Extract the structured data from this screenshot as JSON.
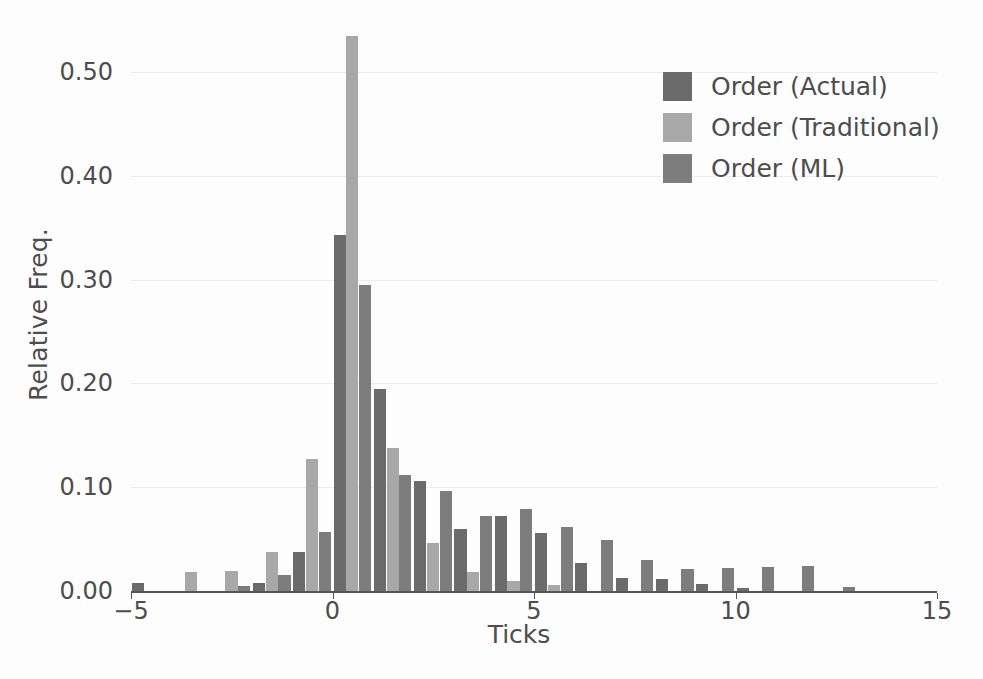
{
  "chart_data": {
    "type": "bar",
    "title": "",
    "subtitle": "",
    "xlabel": "Ticks",
    "ylabel": "Relative Freq.",
    "xlim": [
      -5,
      15
    ],
    "ylim": [
      0.0,
      0.55
    ],
    "xticks": [
      -5,
      0,
      5,
      10,
      15
    ],
    "xtick_labels": [
      "−5",
      "0",
      "5",
      "10",
      "15"
    ],
    "yticks": [
      0.0,
      0.1,
      0.2,
      0.3,
      0.4,
      0.5
    ],
    "ytick_labels": [
      "0.00",
      "0.10",
      "0.20",
      "0.30",
      "0.40",
      "0.50"
    ],
    "grid": true,
    "grid_axis": "y",
    "legend_position": "upper right",
    "bin_width": 1,
    "categories": [
      -5,
      -4,
      -3,
      -2,
      -1,
      0,
      1,
      2,
      3,
      4,
      5,
      6,
      7,
      8,
      9,
      10,
      11,
      12,
      13,
      14
    ],
    "series": [
      {
        "name": "Order (Actual)",
        "color": "#6b6b6b",
        "values": [
          0.008,
          0.0,
          0.0,
          0.008,
          0.038,
          0.343,
          0.195,
          0.106,
          0.06,
          0.072,
          0.056,
          0.027,
          0.013,
          0.012,
          0.007,
          0.003,
          0.0,
          0.0,
          0.0,
          0.0
        ]
      },
      {
        "name": "Order (Traditional)",
        "color": "#a8a8a8",
        "values": [
          0.0,
          0.018,
          0.019,
          0.038,
          0.127,
          0.535,
          0.138,
          0.046,
          0.018,
          0.01,
          0.006,
          0.0,
          0.0,
          0.0,
          0.0,
          0.0,
          0.0,
          0.0,
          0.0,
          0.0
        ]
      },
      {
        "name": "Order (ML)",
        "color": "#7d7d7d",
        "values": [
          0.0,
          0.0,
          0.005,
          0.015,
          0.057,
          0.295,
          0.112,
          0.096,
          0.072,
          0.079,
          0.062,
          0.049,
          0.03,
          0.021,
          0.022,
          0.023,
          0.024,
          0.004,
          0.0,
          0.0
        ]
      }
    ]
  },
  "legend": {
    "items": [
      {
        "label": "Order (Actual)",
        "color": "#6b6b6b"
      },
      {
        "label": "Order (Traditional)",
        "color": "#a8a8a8"
      },
      {
        "label": "Order (ML)",
        "color": "#7d7d7d"
      }
    ]
  },
  "axes": {
    "x_title": "Ticks",
    "y_title": "Relative Freq."
  }
}
